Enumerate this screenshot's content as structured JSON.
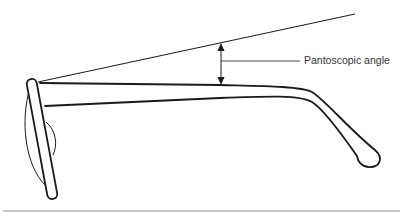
{
  "diagram": {
    "labels": {
      "angle": "Pantoscopic angle"
    },
    "colors": {
      "stroke": "#1a1a1a",
      "text": "#333333",
      "rule": "#888888",
      "background": "#ffffff"
    }
  }
}
